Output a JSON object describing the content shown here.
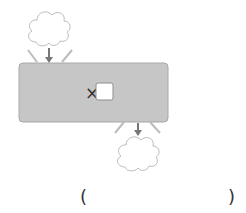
{
  "diagram": {
    "box": {
      "operator": "×",
      "fill": "#c6c6c6",
      "border": "#a8a8a8"
    },
    "input_cloud": {
      "label": ""
    },
    "output_cloud": {
      "label": ""
    },
    "answer": {
      "open_paren": "(",
      "close_paren": ")",
      "value": ""
    },
    "colors": {
      "arrow": "#777777",
      "cloud_stroke": "#bbbbbb",
      "ray": "#bcbcbc"
    }
  }
}
